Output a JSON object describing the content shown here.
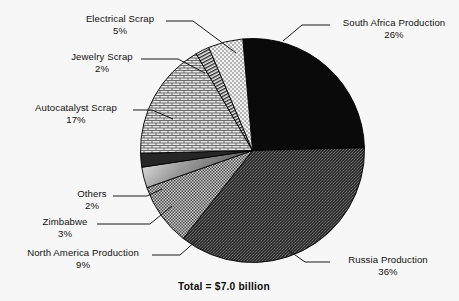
{
  "chart_data": {
    "type": "pie",
    "title": "",
    "total_label": "Total = $7.0 billion",
    "units": "percent of $7.0 billion",
    "legend": "labels with leader lines around pie",
    "grid": false,
    "categories": [
      "South Africa Production",
      "Russia Production",
      "North America Production",
      "Zimbabwe",
      "Others",
      "Autocatalyst Scrap",
      "Jewelry Scrap",
      "Electrical Scrap"
    ],
    "values": [
      26,
      36,
      9,
      3,
      2,
      17,
      2,
      5
    ],
    "slices": [
      {
        "label": "South Africa Production",
        "percent_text": "26%",
        "value": 26,
        "fill": "solid-black",
        "color": "#0a0a0a",
        "start_deg": -5,
        "end_deg": 88.6
      },
      {
        "label": "Russia Production",
        "percent_text": "36%",
        "value": 36,
        "fill": "dark-stipple",
        "color": "#3b3b3b",
        "start_deg": 88.6,
        "end_deg": 218.2
      },
      {
        "label": "North America Production",
        "percent_text": "9%",
        "value": 9,
        "fill": "medium-check",
        "color": "#8a8a8a",
        "start_deg": 218.2,
        "end_deg": 250.6
      },
      {
        "label": "Zimbabwe",
        "percent_text": "3%",
        "value": 3,
        "fill": "gradient-band",
        "color": "#b5b5b5",
        "start_deg": 250.6,
        "end_deg": 261.4
      },
      {
        "label": "Others",
        "percent_text": "2%",
        "value": 2,
        "fill": "dark-band",
        "color": "#2e2e2e",
        "start_deg": 261.4,
        "end_deg": 268.6
      },
      {
        "label": "Autocatalyst Scrap",
        "percent_text": "17%",
        "value": 17,
        "fill": "brick-hatch",
        "color": "#c9c9c9",
        "start_deg": 268.6,
        "end_deg": 329.8
      },
      {
        "label": "Jewelry Scrap",
        "percent_text": "2%",
        "value": 2,
        "fill": "stripes",
        "color": "#9a9a9a",
        "start_deg": 329.8,
        "end_deg": 337
      },
      {
        "label": "Electrical Scrap",
        "percent_text": "5%",
        "value": 5,
        "fill": "light-dots",
        "color": "#e6e6e6",
        "start_deg": 337,
        "end_deg": 355
      }
    ],
    "xlabel": "",
    "ylabel": ""
  },
  "labels": {
    "electrical_scrap": {
      "name": "Electrical Scrap",
      "pct": "5%"
    },
    "jewelry_scrap": {
      "name": "Jewelry Scrap",
      "pct": "2%"
    },
    "autocatalyst_scrap": {
      "name": "Autocatalyst Scrap",
      "pct": "17%"
    },
    "others": {
      "name": "Others",
      "pct": "2%"
    },
    "zimbabwe": {
      "name": "Zimbabwe",
      "pct": "3%"
    },
    "north_america": {
      "name": "North America Production",
      "pct": "9%"
    },
    "south_africa": {
      "name": "South Africa Production",
      "pct": "26%"
    },
    "russia": {
      "name": "Russia Production",
      "pct": "36%"
    }
  },
  "footer": {
    "total": "Total = $7.0 billion"
  },
  "colors": {
    "background": "#f7f7f7",
    "text": "#111111",
    "outline": "#000000"
  }
}
